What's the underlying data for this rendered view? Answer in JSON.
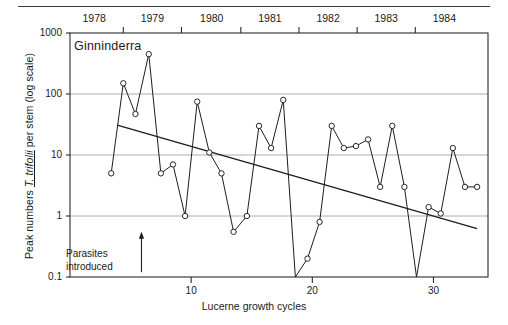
{
  "chart_data": {
    "type": "line",
    "title": "",
    "series_label": "Ginninderra",
    "xlabel": "Lucerne growth cycles",
    "ylabel_prefix": "Peak numbers ",
    "ylabel_species": "T. trifolii",
    "ylabel_suffix": " per stem (log scale)",
    "ylog": true,
    "ylim": [
      0.1,
      1000
    ],
    "yticks": [
      0.1,
      1,
      10,
      100,
      1000
    ],
    "ytick_labels": [
      "0.1",
      "1",
      "10",
      "100",
      "1000"
    ],
    "xlim": [
      0,
      34.5
    ],
    "xticks": [
      10,
      20,
      30
    ],
    "xtick_labels": [
      "10",
      "20",
      "30"
    ],
    "grid": "horizontal",
    "year_axis": {
      "labels": [
        "1978",
        "1979",
        "1980",
        "1981",
        "1982",
        "1983",
        "1984"
      ],
      "label_x": [
        2.0,
        6.8,
        11.7,
        16.5,
        21.3,
        26.1,
        30.9
      ],
      "tick_x": [
        4.4,
        9.2,
        14.1,
        18.9,
        23.7,
        28.5
      ]
    },
    "annotation": {
      "text_line1": "Parasites",
      "text_line2": "introduced",
      "arrow_x": 5.9,
      "arrow_y_from": 0.12,
      "arrow_y_to": 0.55
    },
    "x": [
      3.4,
      4.4,
      5.4,
      6.5,
      7.5,
      8.5,
      9.5,
      10.5,
      11.5,
      12.5,
      13.5,
      14.6,
      15.6,
      16.6,
      17.6,
      18.6,
      19.6,
      20.6,
      21.6,
      22.6,
      23.6,
      24.6,
      25.6,
      26.6,
      27.6,
      28.6,
      29.6,
      30.6,
      31.6,
      32.6,
      33.6
    ],
    "y": [
      5.0,
      150.0,
      47.0,
      450.0,
      5.0,
      7.0,
      1.0,
      75.0,
      11.0,
      5.0,
      0.55,
      1.0,
      30.0,
      13.0,
      80.0,
      0.1,
      0.2,
      0.8,
      30.0,
      13.0,
      14.0,
      18.0,
      3.0,
      30.0,
      3.0,
      0.1,
      1.4,
      1.1,
      13.0,
      3.0,
      3.0
    ],
    "marker": "open-circle",
    "trend_line": {
      "label": "regression trend",
      "x": [
        3.9,
        33.6
      ],
      "y": [
        31.0,
        0.62
      ]
    }
  }
}
